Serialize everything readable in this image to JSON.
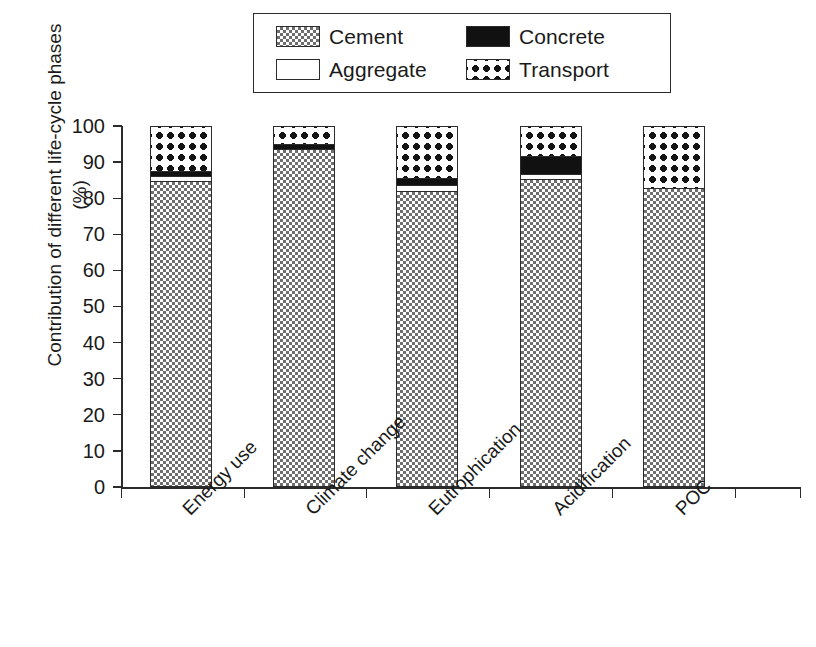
{
  "chart_data": {
    "type": "bar",
    "subtype": "stacked-bar-100-percent",
    "title": "",
    "xlabel": "",
    "ylabel": "Contribution of different life-cycle phases (%)",
    "ylim": [
      0,
      100
    ],
    "yticks": [
      0,
      10,
      20,
      30,
      40,
      50,
      60,
      70,
      80,
      90,
      100
    ],
    "ytick_labels": [
      "0",
      "10",
      "20",
      "30",
      "40",
      "50",
      "60",
      "70",
      "80",
      "90",
      "100"
    ],
    "grid": false,
    "legend_position": "top-center",
    "categories": [
      "Energy use",
      "Climate change",
      "Eutrophication",
      "Acidification",
      "POC"
    ],
    "series": [
      {
        "name": "Cement",
        "pattern": "checkered",
        "color": "#6e6e6e",
        "values": [
          84.7,
          93.6,
          82.0,
          85.3,
          82.8
        ]
      },
      {
        "name": "Aggregate",
        "pattern": "solid-white",
        "color": "#ffffff",
        "values": [
          1.4,
          0.0,
          1.7,
          1.4,
          0.0
        ]
      },
      {
        "name": "Concrete",
        "pattern": "solid-black",
        "color": "#111111",
        "values": [
          1.4,
          1.4,
          1.7,
          5.0,
          0.0
        ]
      },
      {
        "name": "Transport",
        "pattern": "dotted",
        "color": "#141414",
        "values": [
          12.5,
          5.0,
          14.6,
          8.3,
          17.2
        ]
      }
    ]
  },
  "legend": {
    "entries": [
      {
        "label": "Cement",
        "swatch": "cement-swatch"
      },
      {
        "label": "Concrete",
        "swatch": "concrete-swatch"
      },
      {
        "label": "Aggregate",
        "swatch": "aggregate-swatch"
      },
      {
        "label": "Transport",
        "swatch": "transport-swatch"
      }
    ]
  },
  "axes": {
    "y_title": "Contribution of different life-cycle phases (%)",
    "y_ticks": [
      "100",
      "90",
      "80",
      "70",
      "60",
      "50",
      "40",
      "30",
      "20",
      "10",
      "0"
    ],
    "x_categories": [
      "Energy use",
      "Climate change",
      "Eutrophication",
      "Acidification",
      "POC"
    ]
  },
  "colors": {
    "axis": "#2b2b2b",
    "text": "#1a1a1a",
    "cement": "#6e6e6e",
    "concrete": "#111111",
    "aggregate": "#ffffff",
    "transport": "#141414",
    "background": "#ffffff"
  }
}
